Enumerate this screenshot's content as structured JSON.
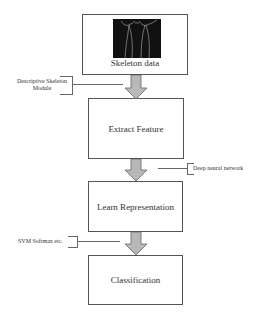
{
  "diagram": {
    "nodes": [
      {
        "id": "skeleton",
        "label": "Skeleton data",
        "has_image": true
      },
      {
        "id": "extract",
        "label": "Extract Feature"
      },
      {
        "id": "learn",
        "label": "Learn Representation"
      },
      {
        "id": "classify",
        "label": "Classification"
      }
    ],
    "edges": [
      {
        "from": "skeleton",
        "to": "extract",
        "annotation": "Descriptive Skeleton Module"
      },
      {
        "from": "extract",
        "to": "learn",
        "annotation": "Deep neural network"
      },
      {
        "from": "learn",
        "to": "classify",
        "annotation": "SVM Softmax etc."
      }
    ],
    "annotations": {
      "a1_line1": "Descriptive Skeleton",
      "a1_line2": "Module",
      "a2": "Deep neural network",
      "a3": "SVM Softmax etc."
    },
    "colors": {
      "arrow_fill": "#b8b8b8",
      "arrow_stroke": "#666666",
      "box_border": "#555555",
      "image_bg": "#111111"
    }
  }
}
